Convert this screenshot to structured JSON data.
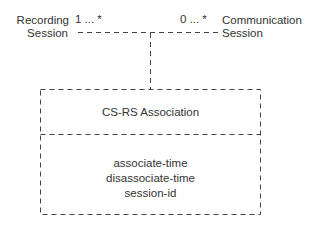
{
  "diagram": {
    "left_entity": {
      "line1": "Recording",
      "line2": "Session"
    },
    "left_multiplicity": "1 ... *",
    "right_entity": {
      "line1": "Communication",
      "line2": "Session"
    },
    "right_multiplicity": "0 ... *",
    "association_class": {
      "name": "CS-RS Association",
      "attributes": [
        "associate-time",
        "disassociate-time",
        "session-id"
      ]
    },
    "line_color": "#444444",
    "line_style": "dashed"
  }
}
